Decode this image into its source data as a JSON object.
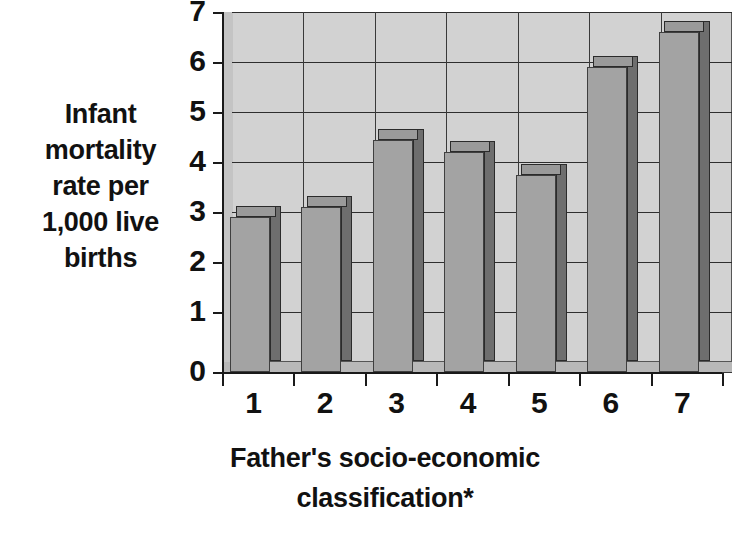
{
  "chart_data": {
    "type": "bar",
    "title": "",
    "xlabel_lines": [
      "Father's socio-economic",
      "classification*"
    ],
    "ylabel_lines": [
      "Infant",
      "mortality",
      "rate per",
      "1,000 live",
      "births"
    ],
    "xlabel": "Father's socio-economic classification*",
    "ylabel": "Infant mortality rate per 1,000 live births",
    "categories": [
      "1",
      "2",
      "3",
      "4",
      "5",
      "6",
      "7"
    ],
    "values": [
      3.1,
      3.3,
      4.65,
      4.4,
      3.95,
      6.1,
      6.8
    ],
    "series": [
      {
        "name": "Infant mortality rate",
        "values": [
          3.1,
          3.3,
          4.65,
          4.4,
          3.95,
          6.1,
          6.8
        ]
      }
    ],
    "ylim": [
      0,
      7
    ],
    "yticks": [
      0,
      1,
      2,
      3,
      4,
      5,
      6,
      7
    ],
    "ytick_labels": [
      "0",
      "1",
      "2",
      "3",
      "4",
      "5",
      "6",
      "7"
    ],
    "xtick_labels": [
      "1",
      "2",
      "3",
      "4",
      "5",
      "6",
      "7"
    ],
    "grid": "horizontal-and-vertical",
    "legend": "none",
    "style": "3d-column",
    "colors": {
      "bar_front": "#a3a3a3",
      "bar_side": "#6e6e6e",
      "bar_top": "#9a9a9a",
      "plot_background": "#d2d2d2",
      "floor": "#b8b8b8",
      "gridline": "#2e2e2e",
      "axis": "#1a1a1a",
      "text": "#111111",
      "page_background": "#ffffff"
    }
  }
}
